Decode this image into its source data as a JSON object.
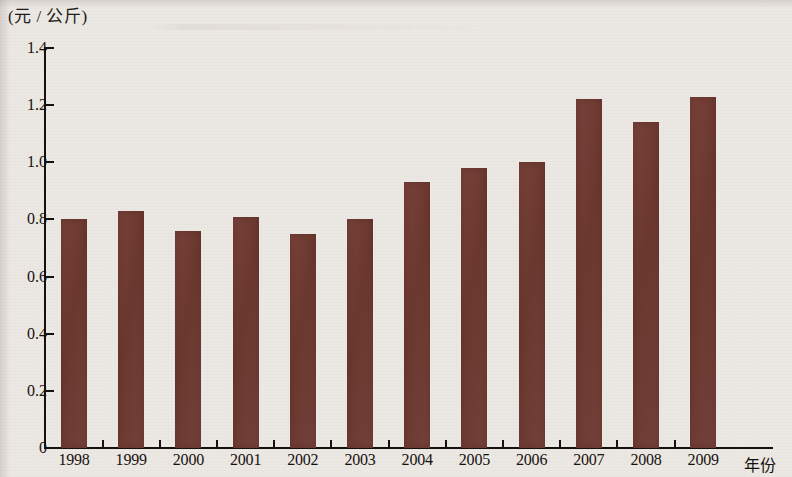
{
  "chart_data": {
    "type": "bar",
    "title": "",
    "subtitle": "",
    "ylabel": "(元 / 公斤)",
    "xlabel": "年份",
    "categories": [
      "1998",
      "1999",
      "2000",
      "2001",
      "2002",
      "2003",
      "2004",
      "2005",
      "2006",
      "2007",
      "2008",
      "2009"
    ],
    "values": [
      0.8,
      0.83,
      0.76,
      0.81,
      0.75,
      0.8,
      0.93,
      0.98,
      1.0,
      1.22,
      1.14,
      1.23
    ],
    "series": [
      {
        "name": "",
        "values": [
          0.8,
          0.83,
          0.76,
          0.81,
          0.75,
          0.8,
          0.93,
          0.98,
          1.0,
          1.22,
          1.14,
          1.23
        ]
      }
    ],
    "ylim": [
      0,
      1.4
    ],
    "ytick_labels": [
      "1.4",
      "1.2",
      "1.0",
      "0.8",
      "0.6",
      "0.4",
      "0.2",
      "0"
    ],
    "ytick_values": [
      1.4,
      1.2,
      1.0,
      0.8,
      0.6,
      0.4,
      0.2,
      0
    ],
    "grid": false,
    "legend_position": "none",
    "bar_color": "#6e3b32",
    "background_color": "#ece8e3",
    "axis_color": "#16110f"
  }
}
